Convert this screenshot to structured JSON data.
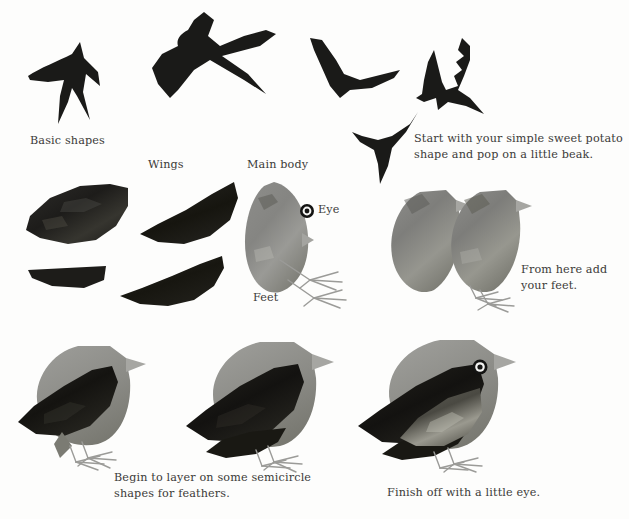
{
  "page": {
    "background_color": "#fdfdfc",
    "ink_color": "#3b3a38",
    "width": 629,
    "height": 519
  },
  "palette": {
    "silhouette_black": "#1a1a18",
    "wing_dark": "#201f1d",
    "body_grey": "#8e8e8c",
    "body_grey_dark": "#6f6f6d",
    "head_grey": "#9a9a97",
    "beak_grey": "#a7a7a4",
    "feet_grey": "#9b9b98",
    "eye_ring": "#141413",
    "eye_white": "#f4f4f2"
  },
  "labels": {
    "basic_shapes": "Basic shapes",
    "wings": "Wings",
    "main_body": "Main body",
    "eye": "Eye",
    "feet": "Feet"
  },
  "captions": {
    "step_beak": "Start with your simple sweet potato\nshape and pop on a little beak.",
    "step_feet": "From here add\nyour feet.",
    "step_feathers": "Begin to layer on some semicircle\nshapes for feathers.",
    "step_eye": "Finish off with a little eye."
  },
  "sections": {
    "basic_shapes_title": "Basic shapes",
    "parts_row_title": "Wings / Main body / Eye / Feet",
    "build_row_title": "Sweet potato shape plus beak",
    "final_row_title": "Layered feathers and eye"
  },
  "figures": {
    "swift_small": "swift-silhouette-small",
    "swallow_large": "swallow-silhouette-large",
    "bird_flying_a": "flying-bird-silhouette-a",
    "bird_flying_b": "flying-bird-silhouette-b",
    "bird_flying_c": "flying-bird-silhouette-c",
    "wing_upper_left": "wing-shape-upper-left",
    "wing_upper_right": "wing-shape-upper-right",
    "wing_lower_left": "wing-shape-lower-left",
    "wing_lower_right": "wing-shape-lower-right",
    "body_teardrop": "main-body-teardrop",
    "eye_swatch": "eye-swatch",
    "beak_swatch": "beak-swatch",
    "feet_swatch": "feet-swatch",
    "bird_body_beak_1": "bird-body-with-beak-1",
    "bird_body_beak_feet": "bird-body-with-beak-and-feet",
    "bird_feathers_1": "bird-with-feathers-step-1",
    "bird_feathers_2": "bird-with-feathers-step-2",
    "bird_finished": "bird-finished-with-eye"
  }
}
